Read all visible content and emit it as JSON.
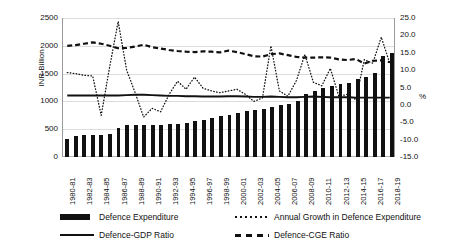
{
  "chart_data": {
    "type": "bar",
    "title": "",
    "xlabel": "",
    "ylabel": "INR Billion",
    "y2label": "%",
    "ylim": [
      0,
      2500
    ],
    "y2lim": [
      -15.0,
      25.0
    ],
    "grid": true,
    "legend_position": "bottom",
    "categories": [
      "1980-81",
      "1981-82",
      "1982-83",
      "1983-84",
      "1984-85",
      "1985-86",
      "1986-87",
      "1987-88",
      "1988-89",
      "1989-90",
      "1990-91",
      "1991-92",
      "1992-93",
      "1993-94",
      "1994-95",
      "1995-96",
      "1996-97",
      "1997-98",
      "1998-99",
      "1999-00",
      "2000-01",
      "2001-02",
      "2002-03",
      "2003-04",
      "2004-05",
      "2005-06",
      "2006-07",
      "2007-08",
      "2008-09",
      "2009-10",
      "2010-11",
      "2011-12",
      "2012-13",
      "2013-14",
      "2014-15",
      "2015-16",
      "2016-17",
      "2017-18",
      "2018-19"
    ],
    "visible_xtick_labels": [
      "1980-81",
      "1982-83",
      "1984-85",
      "1986-87",
      "1988-89",
      "1990-91",
      "1992-93",
      "1994-95",
      "1996-97",
      "1998-99",
      "2000-01",
      "2002-03",
      "2004-05",
      "2006-07",
      "2008-09",
      "2010-11",
      "2012-13",
      "2014-15",
      "2016-17",
      "2018-19"
    ],
    "ytick_labels": [
      "0",
      "500",
      "1000",
      "1500",
      "2000",
      "2500"
    ],
    "ytick_values": [
      0,
      500,
      1000,
      1500,
      2000,
      2500
    ],
    "y2tick_labels": [
      "-15.0",
      "-10.0",
      "-5.0",
      "0.0",
      "5.0",
      "10.0",
      "15.0",
      "20.0",
      "25.0"
    ],
    "y2tick_values": [
      -15.0,
      -10.0,
      -5.0,
      0.0,
      5.0,
      10.0,
      15.0,
      20.0,
      25.0
    ],
    "series": [
      {
        "name": "Defence Expenditure",
        "kind": "bar",
        "axis": "left",
        "color": "#111111",
        "values": [
          330,
          370,
          390,
          400,
          400,
          420,
          520,
          570,
          580,
          570,
          570,
          570,
          600,
          600,
          610,
          640,
          670,
          700,
          730,
          760,
          800,
          820,
          840,
          860,
          900,
          930,
          960,
          1010,
          1130,
          1190,
          1240,
          1280,
          1310,
          1340,
          1400,
          1440,
          1520,
          1810,
          1870
        ]
      },
      {
        "name": "Annual Growth in Defence Expenditure",
        "kind": "line-dotted",
        "axis": "right",
        "color": "#111111",
        "values": [
          9.3,
          9.0,
          8.5,
          8.3,
          -3.0,
          11.0,
          24.0,
          10.0,
          3.5,
          -3.5,
          -1.0,
          -2.0,
          3.0,
          6.8,
          4.5,
          8.0,
          4.8,
          4.0,
          3.5,
          4.0,
          4.5,
          3.0,
          1.0,
          2.0,
          17.0,
          4.0,
          2.5,
          7.0,
          14.5,
          6.5,
          5.5,
          10.5,
          2.5,
          3.0,
          1.5,
          13.0,
          12.0,
          19.5,
          12.0
        ]
      },
      {
        "name": "Defence-GDP Ratio",
        "kind": "line-solid",
        "axis": "right",
        "color": "#111111",
        "values": [
          2.7,
          2.7,
          2.7,
          2.7,
          2.7,
          2.7,
          2.7,
          2.8,
          2.9,
          2.9,
          2.8,
          2.7,
          2.6,
          2.6,
          2.5,
          2.5,
          2.4,
          2.4,
          2.4,
          2.5,
          2.5,
          2.4,
          2.3,
          2.3,
          2.4,
          2.3,
          2.2,
          2.2,
          2.3,
          2.4,
          2.3,
          2.2,
          2.2,
          2.2,
          2.1,
          2.1,
          2.1,
          2.1,
          2.1
        ]
      },
      {
        "name": "Defence-CGE Ratio",
        "kind": "line-dashed",
        "axis": "right",
        "color": "#111111",
        "values": [
          17.0,
          17.2,
          17.6,
          18.0,
          17.6,
          17.0,
          16.3,
          16.4,
          16.8,
          17.3,
          16.6,
          16.2,
          15.8,
          15.5,
          15.3,
          15.2,
          15.4,
          15.3,
          15.1,
          15.6,
          15.2,
          14.6,
          14.0,
          13.9,
          14.6,
          14.8,
          14.3,
          13.8,
          13.6,
          13.6,
          13.7,
          13.6,
          13.1,
          12.9,
          13.2,
          11.9,
          12.7,
          12.8,
          12.3
        ]
      }
    ]
  },
  "axes": {
    "left_title": "INR Billion",
    "right_title": "%"
  },
  "legend": {
    "items": [
      {
        "label": "Defence Expenditure",
        "key": "bar-key-icon"
      },
      {
        "label": "Annual Growth in Defence Expenditure",
        "key": "dotted-line-key-icon"
      },
      {
        "label": "Defence-GDP Ratio",
        "key": "solid-line-key-icon"
      },
      {
        "label": "Defence-CGE Ratio",
        "key": "dashed-line-key-icon"
      }
    ]
  }
}
